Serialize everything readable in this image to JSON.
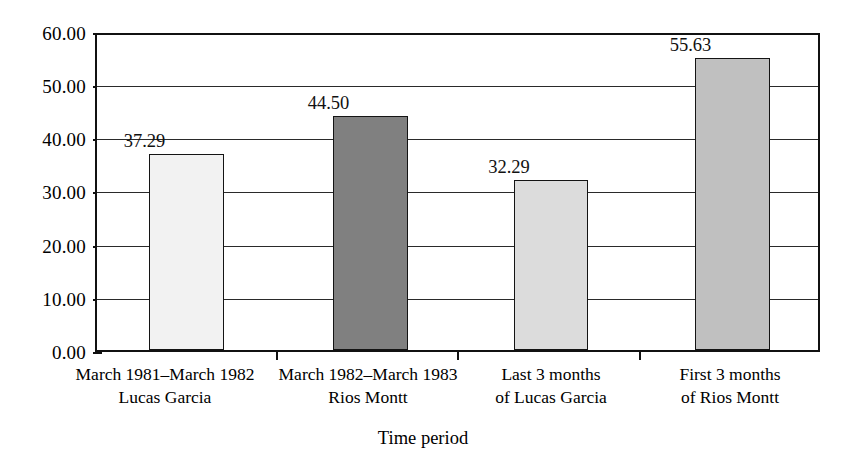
{
  "chart_data": {
    "type": "bar",
    "title": "",
    "subtitle": "",
    "xlabel": "Time period",
    "ylabel": "",
    "ylim": [
      0,
      60
    ],
    "ytick_step": 10,
    "grid": true,
    "legend": "none",
    "categories": [
      "March 1981–March 1982 Lucas Garcia",
      "March 1982–March 1983 Rios Montt",
      "Last 3 months of Lucas Garcia",
      "First 3 months of Rios Montt"
    ],
    "category_lines": [
      [
        "March 1981–March 1982",
        "Lucas Garcia"
      ],
      [
        "March 1982–March 1983",
        "Rios Montt"
      ],
      [
        "Last 3 months",
        "of Lucas Garcia"
      ],
      [
        "First 3 months",
        "of Rios Montt"
      ]
    ],
    "values": [
      37.29,
      44.5,
      32.29,
      55.63
    ],
    "value_labels": [
      "37.29",
      "44.50",
      "32.29",
      "55.63"
    ],
    "bar_colors": [
      "#f2f2f2",
      "#808080",
      "#dcdcdc",
      "#c0c0c0"
    ],
    "bar_border_color": "#141414",
    "ytick_labels": [
      "0.00",
      "10.00",
      "20.00",
      "30.00",
      "40.00",
      "50.00",
      "60.00"
    ],
    "ytick_values": [
      0,
      10,
      20,
      30,
      40,
      50,
      60
    ]
  },
  "axis": {
    "x_title": "Time period"
  }
}
